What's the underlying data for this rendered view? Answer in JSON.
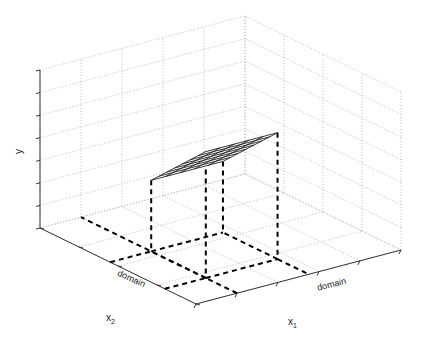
{
  "chart_data": {
    "type": "surface3d",
    "title": "",
    "axes": {
      "x1": {
        "label": "x",
        "subscript": "1",
        "tick_label": "domain",
        "ticks": 5
      },
      "x2": {
        "label": "x",
        "subscript": "2",
        "tick_label": "domain",
        "ticks": 4
      },
      "y": {
        "label": "y",
        "ticks": 7
      }
    },
    "grid": true,
    "grid_style": "dotted",
    "surface": {
      "description": "planar tilted rectangular patch (linear function over a sub-domain)",
      "mesh_rows": 7,
      "mesh_cols": 5,
      "corners_3d": [
        {
          "x1": 0.2,
          "x2": 0.55,
          "y": 0.45
        },
        {
          "x1": 0.55,
          "x2": 0.55,
          "y": 0.45
        },
        {
          "x1": 0.55,
          "x2": 0.2,
          "y": 0.8
        },
        {
          "x1": 0.2,
          "x2": 0.2,
          "y": 0.8
        }
      ]
    },
    "projection_lines": {
      "style": "dashed",
      "description": "vertical drops from surface corners to floor, and floor lines extending to x1/x2 axes marking the domain"
    }
  },
  "labels": {
    "y": "y",
    "x1_main": "x",
    "x1_sub": "1",
    "x2_main": "x",
    "x2_sub": "2",
    "x1_domain": "domain",
    "x2_domain": "domain"
  }
}
